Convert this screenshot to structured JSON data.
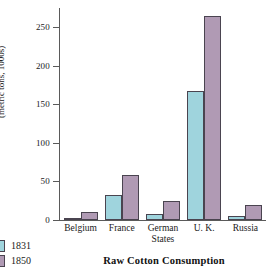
{
  "chart_data": {
    "type": "bar",
    "title": "Raw Cotton Consumption",
    "xlabel": "",
    "ylabel": "(metric tons, 1000s)",
    "categories": [
      "Belgium",
      "France",
      "German States",
      "U. K.",
      "Russia"
    ],
    "category_lines": [
      [
        "Belgium"
      ],
      [
        "France"
      ],
      [
        "German",
        "States"
      ],
      [
        "U. K."
      ],
      [
        "Russia"
      ]
    ],
    "series": [
      {
        "name": "1831",
        "color": "#9fd4dd",
        "values": [
          1,
          33,
          8,
          168,
          5
        ]
      },
      {
        "name": "1850",
        "color": "#b09ab4",
        "values": [
          10,
          58,
          25,
          264,
          20
        ]
      }
    ],
    "ylim": [
      0,
      275
    ],
    "yticks": [
      0,
      50,
      100,
      150,
      200,
      250
    ],
    "ytick_labels": [
      "0",
      "50",
      "100",
      "150",
      "200",
      "250"
    ],
    "grid": false,
    "legend_position": "bottom-left"
  },
  "colors": {
    "series_1831": "#9fd4dd",
    "series_1850": "#b09ab4",
    "axis": "#5a5a5a",
    "bar_outline": "#4a4450",
    "background": "#ffffff"
  }
}
